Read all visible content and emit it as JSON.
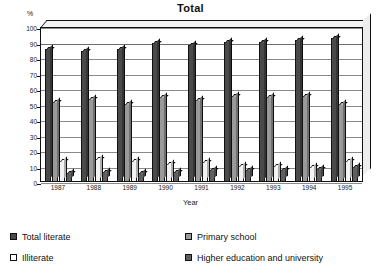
{
  "chart_data": {
    "type": "bar",
    "title": "Total",
    "xlabel": "Year",
    "ylabel": "%",
    "ylim": [
      0,
      100
    ],
    "ytick_step": 10,
    "yticks": [
      100,
      90,
      80,
      70,
      60,
      50,
      40,
      30,
      20,
      10,
      0
    ],
    "grid": true,
    "legend_position": "bottom",
    "categories": [
      "1987",
      "1988",
      "1989",
      "1990",
      "1991",
      "1992",
      "1993",
      "1994",
      "1995"
    ],
    "series": [
      {
        "name": "Total literate",
        "color": "#4a4a4a",
        "values": [
          85,
          84,
          85,
          89,
          88,
          90,
          90,
          91,
          92
        ]
      },
      {
        "name": "Primary school",
        "color": "#9a9a9a",
        "values": [
          51,
          53,
          50,
          54,
          52,
          55,
          54,
          55,
          50
        ]
      },
      {
        "name": "Illiterate",
        "color": "#f2f2f2",
        "values": [
          13,
          14,
          13,
          11,
          12,
          10,
          10,
          9,
          13
        ]
      },
      {
        "name": "Higher education and university",
        "color": "#5f5f5f",
        "values": [
          5,
          6,
          5,
          6,
          7,
          7,
          7,
          8,
          9
        ]
      }
    ]
  },
  "legend": {
    "items": [
      {
        "label": "Total literate",
        "color": "#4a4a4a"
      },
      {
        "label": "Primary school",
        "color": "#9a9a9a"
      },
      {
        "label": "Illiterate",
        "color": "#ffffff"
      },
      {
        "label": "Higher education and university",
        "color": "#5f5f5f"
      }
    ]
  }
}
